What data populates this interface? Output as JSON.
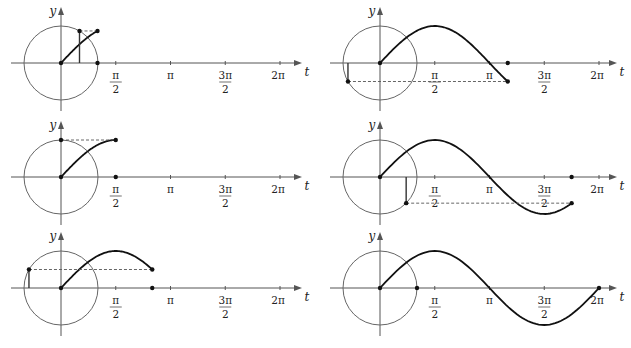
{
  "figure": {
    "axis_labels": {
      "vertical": "y",
      "horizontal": "t"
    },
    "tick_labels": [
      {
        "key": "half_pi",
        "num": "π",
        "den": "2",
        "t": 1.5707963
      },
      {
        "key": "pi",
        "num": "π",
        "den": "",
        "t": 3.1415927
      },
      {
        "key": "three_half_pi",
        "num": "3π",
        "den": "2",
        "t": 4.712389
      },
      {
        "key": "two_pi",
        "num": "2π",
        "den": "",
        "t": 6.2831853
      }
    ],
    "colors": {
      "curve": "#111111",
      "circle": "#666666",
      "axis": "#555555"
    }
  },
  "panels": [
    {
      "id": "panel-t-pi-over-3",
      "column": "left",
      "row": 1,
      "t_label": "π/3",
      "t": 1.0471976
    },
    {
      "id": "panel-t-pi-over-2",
      "column": "left",
      "row": 2,
      "t_label": "π/2",
      "t": 1.5707963
    },
    {
      "id": "panel-t-5pi-over-6",
      "column": "left",
      "row": 3,
      "t_label": "5π/6",
      "t": 2.6179939
    },
    {
      "id": "panel-t-7pi-over-6",
      "column": "right",
      "row": 1,
      "t_label": "7π/6",
      "t": 3.6651914
    },
    {
      "id": "panel-t-7pi-over-4",
      "column": "right",
      "row": 2,
      "t_label": "7π/4",
      "t": 5.497787
    },
    {
      "id": "panel-t-2pi",
      "column": "right",
      "row": 3,
      "t_label": "2π",
      "t": 6.2831853
    }
  ]
}
